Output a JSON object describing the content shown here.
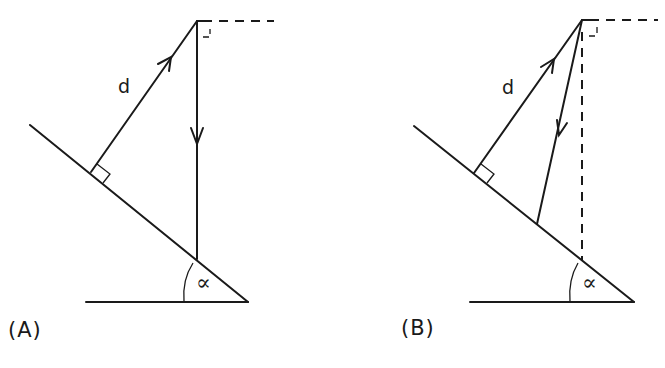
{
  "figure": {
    "panels": [
      {
        "id": "A",
        "label": "(A)",
        "distance_label": "d",
        "angle_label": "∝",
        "description": "Vertical ray from apex to slope; perpendicular distance d to slope"
      },
      {
        "id": "B",
        "label": "(B)",
        "distance_label": "d",
        "angle_label": "∝",
        "description": "Oblique ray from apex to slope; dashed vertical reference; perpendicular distance d"
      }
    ],
    "colors": {
      "stroke": "#1a1a1a",
      "background": "#ffffff"
    }
  }
}
